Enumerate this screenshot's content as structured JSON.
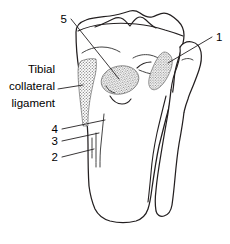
{
  "figure": {
    "name": "proximal-tibia-fibula-anterior-view",
    "background_color": "#ffffff",
    "line_color": "#231f20",
    "stipple_color": "#6b6b6b",
    "width": 230,
    "height": 244
  },
  "text_labels": {
    "tibial_collateral": {
      "line1": "Tibial",
      "line2": "collateral",
      "line3": "ligament"
    }
  },
  "number_labels": {
    "one": "1",
    "two": "2",
    "three": "3",
    "four": "4",
    "five": "5"
  }
}
